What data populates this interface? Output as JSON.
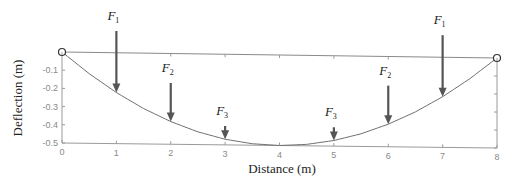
{
  "chart_data": {
    "type": "line",
    "title": "",
    "xlabel": "Distance (m)",
    "ylabel": "Deflection (m)",
    "xlim": [
      0,
      8
    ],
    "ylim": [
      -0.5,
      0
    ],
    "x_ticks": [
      "0",
      "1",
      "2",
      "3",
      "4",
      "5",
      "6",
      "7",
      "8"
    ],
    "y_ticks": [
      "-0.1",
      "-0.2",
      "-0.3",
      "-0.4",
      "-0.5"
    ],
    "grid": false,
    "legend": null,
    "series": [
      {
        "name": "Deflection curve",
        "x": [
          0,
          0.5,
          1,
          1.5,
          2,
          2.5,
          3,
          3.5,
          4,
          4.5,
          5,
          5.5,
          6,
          6.5,
          7,
          7.5,
          8
        ],
        "values": [
          0,
          -0.117,
          -0.219,
          -0.305,
          -0.375,
          -0.43,
          -0.469,
          -0.492,
          -0.5,
          -0.492,
          -0.469,
          -0.43,
          -0.375,
          -0.305,
          -0.219,
          -0.117,
          0
        ]
      }
    ],
    "supports": [
      {
        "x": 0,
        "y": 0,
        "type": "pin"
      },
      {
        "x": 8,
        "y": 0,
        "type": "pin"
      }
    ],
    "forces": [
      {
        "label": "F",
        "sub": "1",
        "x": 1
      },
      {
        "label": "F",
        "sub": "2",
        "x": 2
      },
      {
        "label": "F",
        "sub": "3",
        "x": 3
      },
      {
        "label": "F",
        "sub": "3",
        "x": 5
      },
      {
        "label": "F",
        "sub": "2",
        "x": 6
      },
      {
        "label": "F",
        "sub": "1",
        "x": 7
      }
    ],
    "colors": {
      "curve": "#707070",
      "arrow": "#555555",
      "axis": "#9a9a9a"
    }
  }
}
